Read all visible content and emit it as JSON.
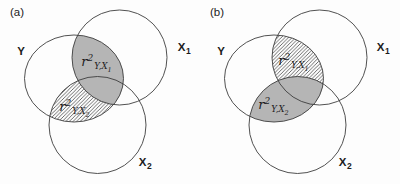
{
  "panels": [
    {
      "tag": "(a)",
      "labels": {
        "y": "Y",
        "x1_base": "X",
        "x1_sub": "1",
        "x2_base": "X",
        "x2_sub": "2"
      },
      "x1_region": {
        "style": "gray",
        "base": "r",
        "sup": "2",
        "sub": "Y,X",
        "subsub": "1"
      },
      "x2_region": {
        "style": "hatched",
        "base": "r",
        "sup": "2",
        "sub": "Y,X",
        "subsub": "2"
      }
    },
    {
      "tag": "(b)",
      "labels": {
        "y": "Y",
        "x1_base": "X",
        "x1_sub": "1",
        "x2_base": "X",
        "x2_sub": "2"
      },
      "x1_region": {
        "style": "hatched",
        "base": "r",
        "sup": "2",
        "sub": "Y,X",
        "subsub": "1"
      },
      "x2_region": {
        "style": "gray",
        "base": "r",
        "sup": "2",
        "sub": "Y,X",
        "subsub": "2"
      }
    }
  ],
  "colors": {
    "region_gray": "#b5b5b5",
    "stroke": "#3d3d3d",
    "hatch_line": "#2f2f2f",
    "background": "#fdfdfd",
    "text": "#1c1c1c"
  }
}
